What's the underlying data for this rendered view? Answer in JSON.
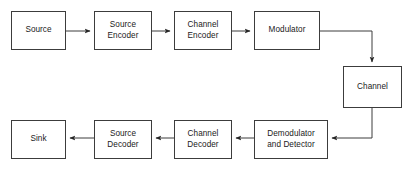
{
  "diagram": {
    "type": "block-flow-diagram",
    "canvas": {
      "width": 410,
      "height": 170
    },
    "style": {
      "background_color": "#ffffff",
      "box_fill_color": "#ffffff",
      "box_border_color": "#3c3c3c",
      "connector_color": "#3c3c3c",
      "text_color": "#1a1a1a"
    },
    "blocks": [
      {
        "id": "source",
        "label": "Source",
        "x": 11,
        "y": 11,
        "width": 55,
        "height": 39,
        "row": "top"
      },
      {
        "id": "source-encoder",
        "label": "Source\nEncoder",
        "x": 94,
        "y": 11,
        "width": 58,
        "height": 39,
        "row": "top"
      },
      {
        "id": "channel-encoder",
        "label": "Channel\nEncoder",
        "x": 174,
        "y": 11,
        "width": 58,
        "height": 39,
        "row": "top"
      },
      {
        "id": "modulator",
        "label": "Modulator",
        "x": 254,
        "y": 11,
        "width": 66,
        "height": 39,
        "row": "top"
      },
      {
        "id": "channel",
        "label": "Channel",
        "x": 343,
        "y": 66,
        "width": 59,
        "height": 42,
        "row": "middle"
      },
      {
        "id": "demodulator-and-detector",
        "label": "Demodulator\nand Detector",
        "x": 254,
        "y": 120,
        "width": 74,
        "height": 39,
        "row": "bottom"
      },
      {
        "id": "channel-decoder",
        "label": "Channel\nDecoder",
        "x": 174,
        "y": 120,
        "width": 58,
        "height": 39,
        "row": "bottom"
      },
      {
        "id": "source-decoder",
        "label": "Source\nDecoder",
        "x": 94,
        "y": 120,
        "width": 58,
        "height": 39,
        "row": "bottom"
      },
      {
        "id": "sink",
        "label": "Sink",
        "x": 11,
        "y": 120,
        "width": 55,
        "height": 39,
        "row": "bottom"
      }
    ],
    "connectors": [
      {
        "id": "source-to-source-encoder",
        "from": "source",
        "to": "source-encoder",
        "direction": "right",
        "points": "66,31 94,31"
      },
      {
        "id": "source-encoder-to-channel-encoder",
        "from": "source-encoder",
        "to": "channel-encoder",
        "direction": "right",
        "points": "152,31 174,31"
      },
      {
        "id": "channel-encoder-to-modulator",
        "from": "channel-encoder",
        "to": "modulator",
        "direction": "right",
        "points": "232,31 254,31"
      },
      {
        "id": "modulator-to-channel",
        "from": "modulator",
        "to": "channel",
        "direction": "down",
        "points": "320,31 372,31 372,66"
      },
      {
        "id": "channel-to-demodulator",
        "from": "channel",
        "to": "demodulator-and-detector",
        "direction": "left",
        "points": "372,108 372,138 328,138"
      },
      {
        "id": "demodulator-to-channel-decoder",
        "from": "demodulator-and-detector",
        "to": "channel-decoder",
        "direction": "left",
        "points": "254,138 232,138"
      },
      {
        "id": "channel-decoder-to-source-decoder",
        "from": "channel-decoder",
        "to": "source-decoder",
        "direction": "left",
        "points": "174,138 152,138"
      },
      {
        "id": "source-decoder-to-sink",
        "from": "source-decoder",
        "to": "sink",
        "direction": "left",
        "points": "94,138 66,138"
      }
    ]
  }
}
